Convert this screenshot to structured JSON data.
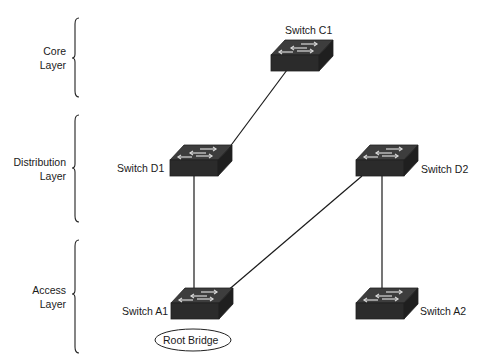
{
  "layers": [
    {
      "line1": "Core",
      "line2": "Layer"
    },
    {
      "line1": "Distribution",
      "line2": "Layer"
    },
    {
      "line1": "Access",
      "line2": "Layer"
    }
  ],
  "switches": {
    "c1": {
      "label": "Switch C1"
    },
    "d1": {
      "label": "Switch D1"
    },
    "d2": {
      "label": "Switch D2"
    },
    "a1": {
      "label": "Switch A1"
    },
    "a2": {
      "label": "Switch A2"
    }
  },
  "root_bridge": {
    "label": "Root Bridge"
  },
  "links": [
    {
      "from": "Switch C1",
      "to": "Switch D1"
    },
    {
      "from": "Switch D1",
      "to": "Switch A1"
    },
    {
      "from": "Switch D2",
      "to": "Switch A1"
    },
    {
      "from": "Switch D2",
      "to": "Switch A2"
    }
  ],
  "colors": {
    "switch_body": "#2a2a2a",
    "switch_top": "#3a3a3a",
    "line": "#1a1a1a"
  }
}
